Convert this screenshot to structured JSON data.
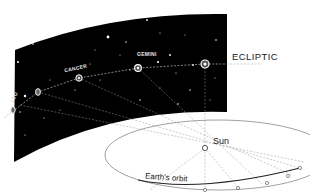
{
  "diagram": {
    "type": "celestial sphere projection",
    "labels": {
      "ecliptic": "ECLIPTIC",
      "sun": "Sun",
      "orbit": "Earth's orbit",
      "constellations": [
        "LEO",
        "CANCER",
        "GEMINI"
      ]
    },
    "colors": {
      "sky": "#000000",
      "background": "#ffffff",
      "star": "#ffffff",
      "line": "#888888",
      "text": "#222222"
    }
  }
}
